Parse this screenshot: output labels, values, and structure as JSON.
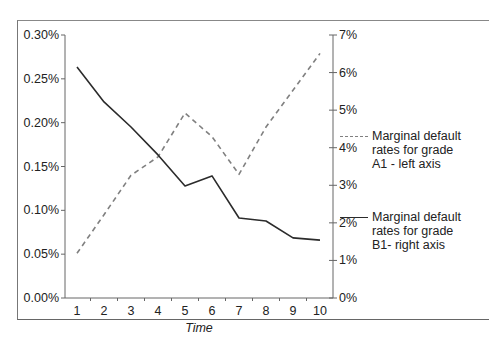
{
  "chart_data": {
    "type": "line",
    "title": "",
    "xlabel": "Time",
    "ylabel": "",
    "ylabel_right": "",
    "x": [
      1,
      2,
      3,
      4,
      5,
      6,
      7,
      8,
      9,
      10
    ],
    "x_ticks": [
      "1",
      "2",
      "3",
      "4",
      "5",
      "6",
      "7",
      "8",
      "9",
      "10"
    ],
    "y_left_ticks": [
      "0.00%",
      "0.05%",
      "0.10%",
      "0.15%",
      "0.20%",
      "0.25%",
      "0.30%"
    ],
    "y_left_range": [
      0,
      0.3
    ],
    "y_right_ticks": [
      "0%",
      "1%",
      "2%",
      "3%",
      "4%",
      "5%",
      "6%",
      "7%"
    ],
    "y_right_range": [
      0,
      7
    ],
    "grid": false,
    "legend_position": "right",
    "series": [
      {
        "name": "Marginal default rates for grade A1 - left axis",
        "axis": "left",
        "style": "dashed",
        "color": "#808080",
        "unit": "%",
        "values": [
          0.051,
          0.095,
          0.14,
          0.161,
          0.211,
          0.184,
          0.141,
          0.195,
          0.237,
          0.279
        ]
      },
      {
        "name": "Marginal default rates for grade B1- right axis",
        "axis": "right",
        "style": "solid",
        "color": "#2b2b2b",
        "unit": "%",
        "values": [
          6.15,
          5.22,
          4.55,
          3.81,
          2.98,
          3.25,
          2.13,
          2.05,
          1.6,
          1.54
        ]
      }
    ]
  },
  "legend": {
    "a1": "Marginal default\nrates for grade\nA1 - left axis",
    "b1": "Marginal default\nrates for grade\nB1- right axis"
  }
}
